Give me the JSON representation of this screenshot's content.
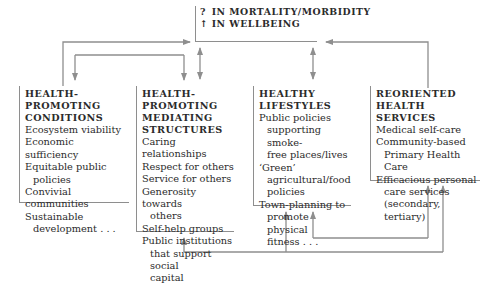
{
  "outcome": {
    "lines": [
      {
        "glyph": "?",
        "text": "IN MORTALITY/MORBIDITY"
      },
      {
        "glyph": "↑",
        "text": "IN WELLBEING"
      }
    ]
  },
  "boxes": [
    {
      "title": "HEALTH-\nPROMOTING\nCONDITIONS",
      "items": [
        [
          "Ecosystem viability"
        ],
        [
          "Economic sufficiency"
        ],
        [
          "Equitable public",
          "policies"
        ],
        [
          "Convivial communities"
        ],
        [
          "Sustainable",
          "development . . ."
        ]
      ]
    },
    {
      "title": "HEALTH-PROMOTING\nMEDIATING\nSTRUCTURES",
      "items": [
        [
          "Caring relationships"
        ],
        [
          "Respect for others"
        ],
        [
          "Service for others"
        ],
        [
          "Generosity towards",
          "others"
        ],
        [
          "Self-help groups"
        ],
        [
          "Public institutions",
          "that support social",
          "capital"
        ]
      ]
    },
    {
      "title": "HEALTHY LIFESTYLES",
      "items": [
        [
          "Public policies",
          "supporting smoke-",
          "free places/lives"
        ],
        [
          "‘Green’",
          "agricultural/food",
          "policies"
        ],
        [
          "Town-planning to",
          "promote physical",
          "fitness . . ."
        ]
      ]
    },
    {
      "title": "REORIENTED HEALTH\nSERVICES",
      "items": [
        [
          "Medical self-care"
        ],
        [
          "Community-based",
          "Primary Health Care"
        ],
        [
          "Efficacious personal",
          "care services",
          "(secondary, tertiary)"
        ]
      ]
    }
  ],
  "colors": {
    "line": "#8e8e8e",
    "text": "#2b2b2b"
  }
}
